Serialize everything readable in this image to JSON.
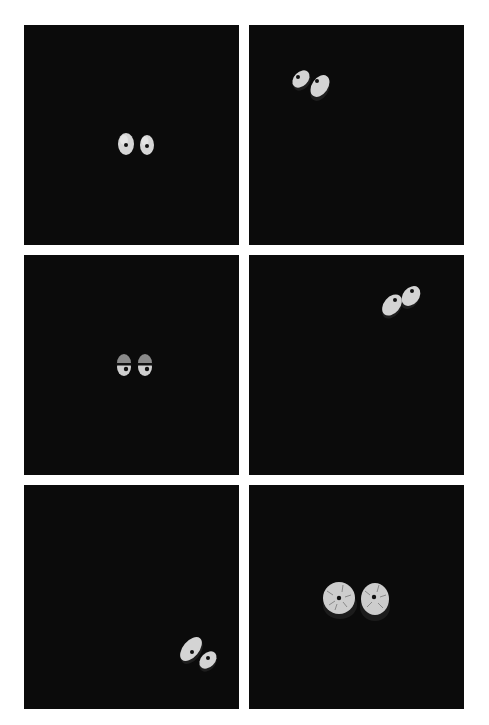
{
  "grid": {
    "rows": 3,
    "cols": 2,
    "background": "#ffffff",
    "panel_color": "#0b0b0b"
  },
  "panels": [
    {
      "id": "top-left",
      "state": "eyes-center-upright",
      "expression": "neutral",
      "eye_color": "#d8d8d8"
    },
    {
      "id": "top-right",
      "state": "eyes-upper-left-tilted",
      "expression": "neutral",
      "eye_color": "#d8d8d8"
    },
    {
      "id": "middle-left",
      "state": "eyes-center-half-lidded",
      "expression": "sleepy",
      "eye_color": "#d8d8d8"
    },
    {
      "id": "middle-right",
      "state": "eyes-upper-right-tilted",
      "expression": "neutral",
      "eye_color": "#d8d8d8"
    },
    {
      "id": "bottom-left",
      "state": "eyes-lower-right-tilted",
      "expression": "neutral",
      "eye_color": "#d8d8d8"
    },
    {
      "id": "bottom-right",
      "state": "eyes-center-large-bloodshot",
      "expression": "cracked",
      "eye_color": "#d0d0d0"
    }
  ]
}
